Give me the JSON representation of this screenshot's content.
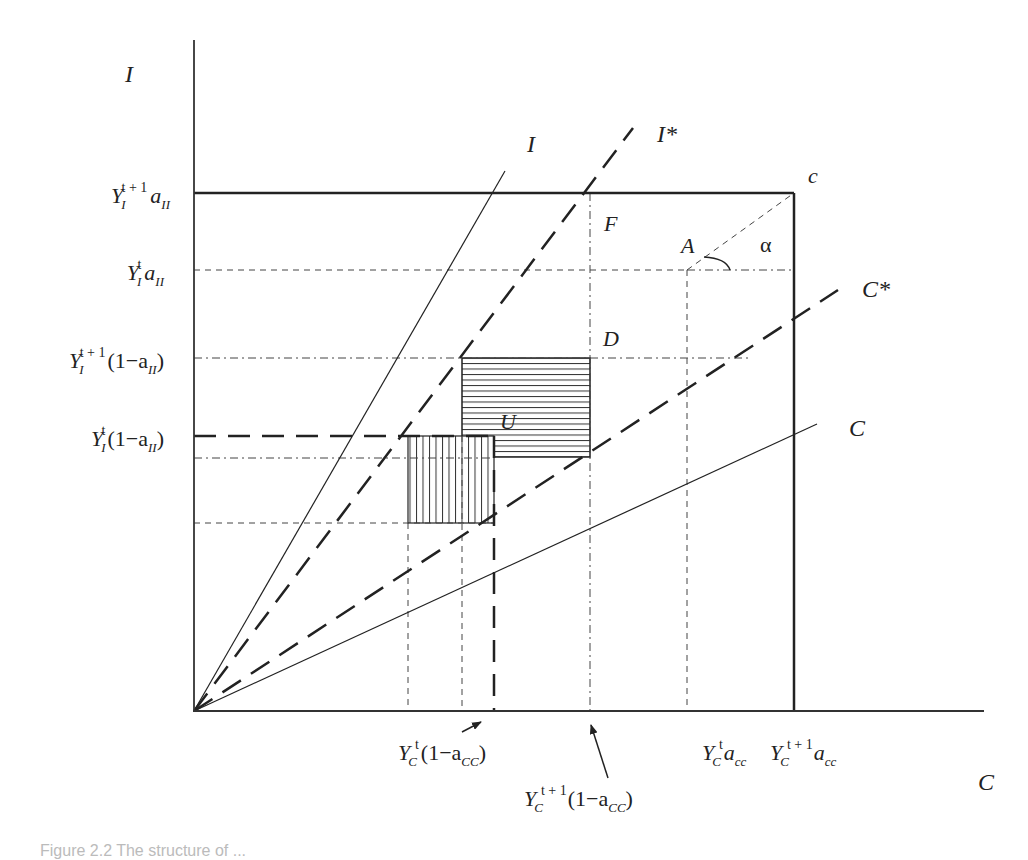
{
  "diagram": {
    "axes": {
      "y_label": "I",
      "x_label": "C",
      "origin": [
        194,
        711
      ],
      "y_axis_top": 40,
      "x_axis_right": 984
    },
    "y_ticks": [
      {
        "base": "Y",
        "sub": "I",
        "sup": "t + 1",
        "rest": "a",
        "rest_sub": "II",
        "paren": false,
        "y": 193
      },
      {
        "base": "Y",
        "sub": "I",
        "sup": "t",
        "rest": "a",
        "rest_sub": "II",
        "paren": false,
        "y": 270
      },
      {
        "base": "Y",
        "sub": "I",
        "sup": "t + 1",
        "rest": "(1−a",
        "rest_sub": "II",
        "close": ")",
        "paren": true,
        "y": 358
      },
      {
        "base": "Y",
        "sub": "I",
        "sup": "t",
        "rest": "(1−a",
        "rest_sub": "II",
        "close": ")",
        "paren": true,
        "y": 436
      }
    ],
    "x_ticks": [
      {
        "base": "Y",
        "sub": "C",
        "sup": "t",
        "rest": "(1−a",
        "rest_sub": "CC",
        "close": ")",
        "x": 494
      },
      {
        "base": "Y",
        "sub": "C",
        "sup": "t + 1",
        "rest": "(1−a",
        "rest_sub": "CC",
        "close": ")",
        "x": 590
      },
      {
        "base": "Y",
        "sub": "C",
        "sup": "t",
        "rest": "a",
        "rest_sub": "cc",
        "x": 687
      },
      {
        "base": "Y",
        "sub": "C",
        "sup": "t + 1",
        "rest": "a",
        "rest_sub": "cc",
        "x": 794
      }
    ],
    "rays": [
      {
        "label": "I",
        "style": "solid",
        "end": [
          505,
          171
        ]
      },
      {
        "label": "I*",
        "style": "long-dash",
        "end": [
          633,
          128
        ]
      },
      {
        "label": "C*",
        "style": "long-dash",
        "end": [
          838,
          290
        ]
      },
      {
        "label": "C",
        "style": "solid",
        "end": [
          817,
          424
        ]
      }
    ],
    "points": {
      "c": "c",
      "A": "A",
      "F": "F",
      "D": "D",
      "U": "U",
      "alpha": "α"
    },
    "regions": [
      {
        "name": "horizontal-hatch",
        "x": 462,
        "y": 358,
        "w": 128,
        "h": 99
      },
      {
        "name": "vertical-hatch",
        "x": 408,
        "y": 436,
        "w": 86,
        "h": 87
      }
    ],
    "colors": {
      "ink": "#222222",
      "background": "#ffffff"
    }
  },
  "caption": "Figure 2.2  The structure of ..."
}
